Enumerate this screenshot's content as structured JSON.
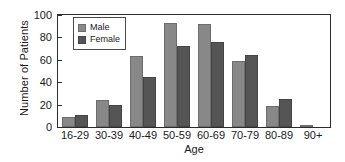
{
  "chart_data": {
    "type": "bar",
    "title": "",
    "xlabel": "Age",
    "ylabel": "Number of Patients",
    "categories": [
      "16-29",
      "30-39",
      "40-49",
      "50-59",
      "60-69",
      "70-79",
      "80-89",
      "90+"
    ],
    "series": [
      {
        "name": "Male",
        "color": "#888888",
        "values": [
          9,
          24,
          63,
          93,
          92,
          59,
          19,
          1.5
        ]
      },
      {
        "name": "Female",
        "color": "#555555",
        "values": [
          11,
          20,
          45,
          72,
          76,
          64,
          25,
          0
        ]
      }
    ],
    "ylim": [
      0,
      100
    ],
    "yticks": [
      0,
      20,
      40,
      60,
      80,
      100
    ],
    "ytick_labels": [
      "0",
      "20",
      "40",
      "60",
      "80",
      "100"
    ],
    "grid": false,
    "legend_position": "top-left",
    "frame": true
  },
  "legend": {
    "entries": [
      {
        "label": "Male"
      },
      {
        "label": "Female"
      }
    ]
  },
  "axes": {
    "x_title": "Age",
    "y_title": "Number of Patients"
  }
}
